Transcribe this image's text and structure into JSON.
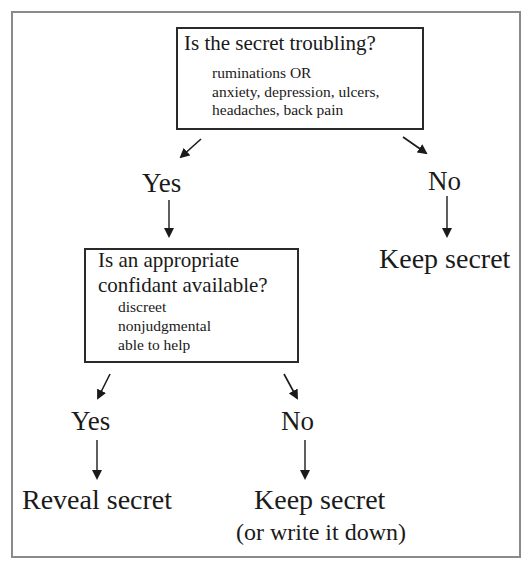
{
  "flowchart": {
    "question1": {
      "title": "Is the secret troubling?",
      "criteria": [
        "ruminations OR",
        "anxiety, depression, ulcers,",
        "headaches, back pain"
      ]
    },
    "branch1_yes": {
      "label": "Yes"
    },
    "branch1_no": {
      "label": "No",
      "outcome": "Keep secret"
    },
    "question2": {
      "title_lines": [
        "Is an appropriate",
        "confidant available?"
      ],
      "criteria": [
        "discreet",
        "nonjudgmental",
        "able to help"
      ]
    },
    "branch2_yes": {
      "label": "Yes",
      "outcome": "Reveal secret"
    },
    "branch2_no": {
      "label": "No",
      "outcome": "Keep secret",
      "note": "(or write it down)"
    }
  },
  "colors": {
    "frame": "#8a8a8a",
    "ink": "#1a1a1a",
    "background": "#ffffff"
  }
}
